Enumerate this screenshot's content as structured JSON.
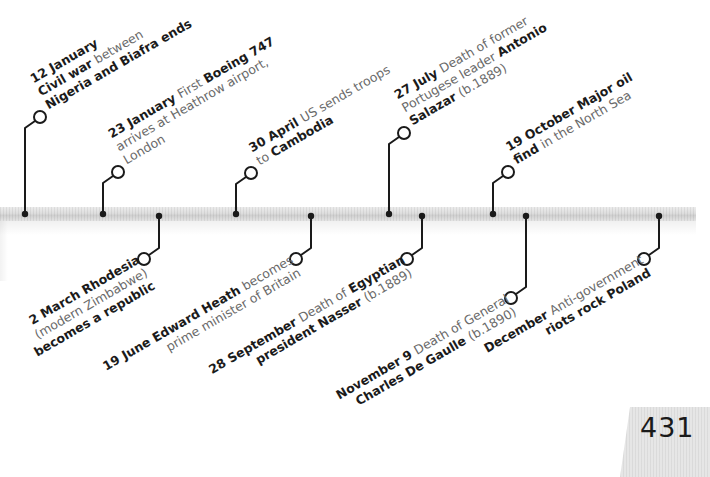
{
  "page_number": "431",
  "colors": {
    "bold_text": "#1b1b1b",
    "light_text": "#6a6a6a",
    "connector": "#1a1a1a",
    "bar": "#dcdcdc"
  },
  "events": [
    {
      "id": "jan12",
      "side": "up",
      "date": "12 January",
      "lines": [
        [
          {
            "t": "12 January",
            "b": true
          }
        ],
        [
          {
            "t": "Civil war ",
            "b": true
          },
          {
            "t": "between",
            "b": false
          }
        ],
        [
          {
            "t": "Nigeria and Biafra ends",
            "b": true
          }
        ]
      ]
    },
    {
      "id": "jan23",
      "side": "up",
      "date": "23 January",
      "lines": [
        [
          {
            "t": "23 January ",
            "b": true
          },
          {
            "t": "First ",
            "b": false
          },
          {
            "t": "Boeing 747",
            "b": true
          }
        ],
        [
          {
            "t": "arrives at Heathrow airport,",
            "b": false
          }
        ],
        [
          {
            "t": "London",
            "b": false
          }
        ]
      ]
    },
    {
      "id": "mar2",
      "side": "down",
      "date": "2 March",
      "lines": [
        [
          {
            "t": "2 March ",
            "b": true
          },
          {
            "t": "Rhodesia",
            "b": true
          }
        ],
        [
          {
            "t": "(modern Zimbabwe)",
            "b": false
          }
        ],
        [
          {
            "t": "becomes a republic",
            "b": true
          }
        ]
      ]
    },
    {
      "id": "apr30",
      "side": "up",
      "date": "30 April",
      "lines": [
        [
          {
            "t": "30 April ",
            "b": true
          },
          {
            "t": "US sends troops",
            "b": false
          }
        ],
        [
          {
            "t": "to ",
            "b": false
          },
          {
            "t": "Cambodia",
            "b": true
          }
        ]
      ]
    },
    {
      "id": "jun19",
      "side": "down",
      "date": "19 June",
      "lines": [
        [
          {
            "t": "19 June Edward Heath ",
            "b": true
          },
          {
            "t": "becomes",
            "b": false
          }
        ],
        [
          {
            "t": "prime minister of Britain",
            "b": false
          }
        ]
      ]
    },
    {
      "id": "jul27",
      "side": "up",
      "date": "27 July",
      "lines": [
        [
          {
            "t": "27 July ",
            "b": true
          },
          {
            "t": "Death of former",
            "b": false
          }
        ],
        [
          {
            "t": "Portugese leader ",
            "b": false
          },
          {
            "t": "Antonio",
            "b": true
          }
        ],
        [
          {
            "t": "Salazar ",
            "b": true
          },
          {
            "t": "(b.1889)",
            "b": false
          }
        ]
      ]
    },
    {
      "id": "sep28",
      "side": "down",
      "date": "28 September",
      "lines": [
        [
          {
            "t": "28 September ",
            "b": true
          },
          {
            "t": "Death of ",
            "b": false
          },
          {
            "t": "Egyptian",
            "b": true
          }
        ],
        [
          {
            "t": "president Nasser ",
            "b": true
          },
          {
            "t": "(b.1889)",
            "b": false
          }
        ]
      ]
    },
    {
      "id": "oct19",
      "side": "up",
      "date": "19 October",
      "lines": [
        [
          {
            "t": "19 October Major oil",
            "b": true
          }
        ],
        [
          {
            "t": "find ",
            "b": true
          },
          {
            "t": "in the North Sea",
            "b": false
          }
        ]
      ]
    },
    {
      "id": "nov9",
      "side": "down",
      "date": "November 9",
      "lines": [
        [
          {
            "t": "November 9 ",
            "b": true
          },
          {
            "t": "Death of General",
            "b": false
          }
        ],
        [
          {
            "t": "Charles De Gaulle ",
            "b": true
          },
          {
            "t": "(b.1890)",
            "b": false
          }
        ]
      ]
    },
    {
      "id": "dec",
      "side": "down",
      "date": "December",
      "lines": [
        [
          {
            "t": "December ",
            "b": true
          },
          {
            "t": "Anti-government",
            "b": false
          }
        ],
        [
          {
            "t": "riots rock Poland",
            "b": true
          }
        ]
      ]
    }
  ]
}
